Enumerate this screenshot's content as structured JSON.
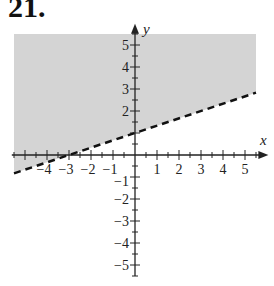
{
  "problem": {
    "number": "21."
  },
  "colors": {
    "shade": "#d4d4d4",
    "axis": "#222222",
    "boundary": "#111111"
  },
  "chart_data": {
    "type": "area",
    "title": "",
    "xlabel": "x",
    "ylabel": "y",
    "xlim": [
      -5.5,
      5.5
    ],
    "ylim": [
      -5.5,
      5.5
    ],
    "x_ticks": [
      -4,
      -3,
      -2,
      -1,
      1,
      2,
      3,
      4,
      5
    ],
    "x_tick_labels": [
      "−4",
      "−3",
      "−2",
      "−1",
      "1",
      "2",
      "3",
      "4",
      "5"
    ],
    "y_ticks": [
      -5,
      -4,
      -3,
      -2,
      -1,
      2,
      3,
      4,
      5
    ],
    "y_tick_labels": [
      "−5",
      "−4",
      "−3",
      "−2",
      "−1",
      "2",
      "3",
      "4",
      "5"
    ],
    "boundary": {
      "slope": 0.3333,
      "intercept": 1,
      "style": "dashed",
      "points": [
        [
          -5.5,
          -0.83
        ],
        [
          0,
          1
        ],
        [
          5.5,
          2.83
        ]
      ]
    },
    "shaded_region": "above",
    "inequality": "y > (1/3)x + 1",
    "grid": false,
    "legend": null
  }
}
